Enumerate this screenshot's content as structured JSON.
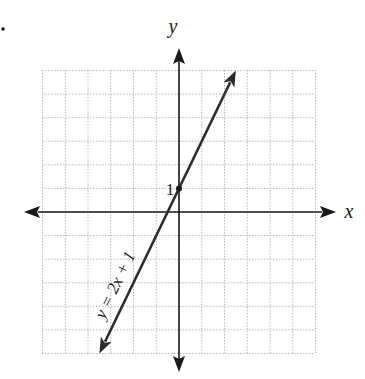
{
  "problem_marker": ".",
  "chart_data": {
    "type": "line",
    "title": "",
    "xlabel": "x",
    "ylabel": "y",
    "xlim": [
      -6,
      6
    ],
    "ylim": [
      -6,
      6
    ],
    "grid": true,
    "grid_style": "dotted",
    "series": [
      {
        "name": "y = 2x + 1",
        "slope": 2,
        "intercept": 1,
        "x": [
          -3.5,
          2.5
        ],
        "y": [
          -6,
          6
        ],
        "arrows_both_ends": true
      }
    ],
    "points": [
      {
        "x": 0,
        "y": 1,
        "label": "1"
      }
    ],
    "annotations": [
      {
        "text": "y = 2x + 1",
        "rotated_along_line": true
      }
    ]
  },
  "labels": {
    "x_axis": "x",
    "y_axis": "y",
    "intercept": "1",
    "equation": "y = 2x + 1"
  },
  "colors": {
    "axis": "#1a1a1a",
    "line": "#2b2b2b",
    "grid": "#b8b8b8"
  }
}
